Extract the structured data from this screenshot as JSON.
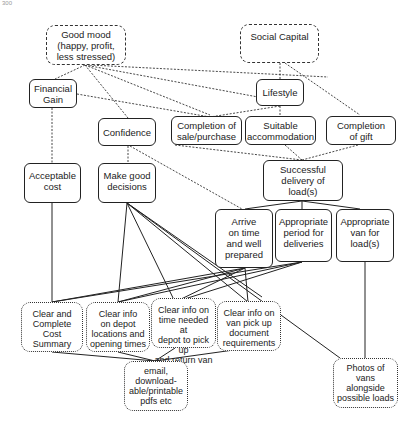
{
  "page_number": "300",
  "nodes": {
    "good_mood": "Good mood\n(happy, profit,\nless stressed)",
    "social_capital": "Social Capital",
    "financial_gain": "Financial\nGain",
    "lifestyle": "Lifestyle",
    "confidence": "Confidence",
    "completion_sale": "Completion of\nsale/purchase",
    "suitable_accommodation": "Suitable\naccommodation",
    "completion_gift": "Completion\nof gift",
    "acceptable_cost": "Acceptable\ncost",
    "make_good_decisions": "Make good\ndecisions",
    "successful_delivery": "Successful\ndelivery of\nload(s)",
    "arrive_on_time": "Arrive\non time\nand well\nprepared",
    "appropriate_period": "Appropriate\nperiod for\ndeliveries",
    "appropriate_van": "Appropriate\nvan for\nload(s)",
    "clear_cost_summary": "Clear and\nComplete Cost\nSummary",
    "clear_depot_info": "Clear info\non depot\nlocations and\nopening times",
    "clear_time_info": "Clear info on\ntime needed at\ndepot to pick up\nand return van",
    "clear_document_info": "Clear info on\nvan pick up\ndocument\nrequirements",
    "email_pdfs": "email,\ndownload-\nable/printable\npdfs etc",
    "photos_of_vans": "Photos of vans\nalongside\npossible loads"
  },
  "legend": {
    "dashed_box": "terminal value",
    "solid_box": "consequence",
    "dotted_box": "attribute"
  }
}
